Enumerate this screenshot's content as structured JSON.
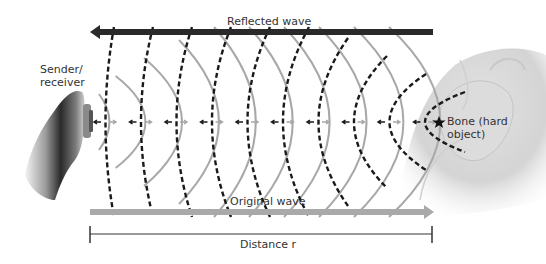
{
  "labels": {
    "reflected_wave": "Reflected wave",
    "original_wave": "Original wave",
    "distance": "Distance r",
    "sender_line1": "Sender/",
    "sender_line2": "receiver",
    "bone_line1": "Bone (hard",
    "bone_line2": "object)"
  },
  "wave_fronts": {
    "original_count": 10,
    "reflected_count": 10,
    "original_style": "solid-gray",
    "reflected_style": "dashed-black"
  },
  "colors": {
    "reflected_arrow": "#2a2a2a",
    "original_arrow": "#a9a9a9",
    "reflected_wavefront": "#1a1a1a",
    "original_wavefront": "#a8a8a8",
    "distance_line": "#333333",
    "text": "#333333"
  }
}
